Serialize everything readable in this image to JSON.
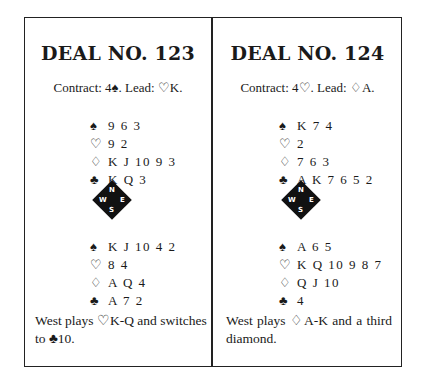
{
  "deals": [
    {
      "title": "DEAL NO. 123",
      "contract": "Contract: 4♠. Lead: ♡K.",
      "north": [
        {
          "suit": "♠",
          "cards": "9 6 3"
        },
        {
          "suit": "♡",
          "cards": "9 2"
        },
        {
          "suit": "♢",
          "cards": "K J 10 9 3"
        },
        {
          "suit": "♣",
          "cards": "K Q 3"
        }
      ],
      "south": [
        {
          "suit": "♠",
          "cards": "K J 10 4 2"
        },
        {
          "suit": "♡",
          "cards": "8 4"
        },
        {
          "suit": "♢",
          "cards": "A Q 4"
        },
        {
          "suit": "♣",
          "cards": "A 7 2"
        }
      ],
      "note": "West plays ♡K-Q and switches to ♣10."
    },
    {
      "title": "DEAL NO. 124",
      "contract": "Contract: 4♡. Lead: ♢A.",
      "north": [
        {
          "suit": "♠",
          "cards": "K 7 4"
        },
        {
          "suit": "♡",
          "cards": "2"
        },
        {
          "suit": "♢",
          "cards": "7 6 3"
        },
        {
          "suit": "♣",
          "cards": "A K 7 6 5 2"
        }
      ],
      "south": [
        {
          "suit": "♠",
          "cards": "A 6 5"
        },
        {
          "suit": "♡",
          "cards": "K Q 10 9 8 7"
        },
        {
          "suit": "♢",
          "cards": "Q J 10"
        },
        {
          "suit": "♣",
          "cards": "4"
        }
      ],
      "note": "West plays ♢A-K and a third diamond."
    }
  ],
  "compass": {
    "n": "N",
    "s": "S",
    "e": "E",
    "w": "W"
  }
}
